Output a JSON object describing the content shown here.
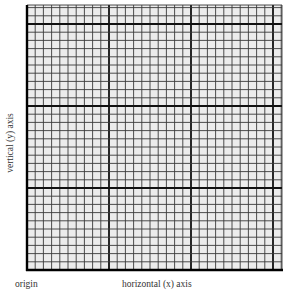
{
  "diagram": {
    "type": "graph-paper",
    "labels": {
      "y_axis": "vertical (y) axis",
      "x_axis": "horizontal (x) axis",
      "origin": "origin"
    },
    "grid": {
      "left": 27,
      "top": 5,
      "right": 282,
      "bottom": 270,
      "minor_cell_px": 8.2,
      "major_every": 10,
      "colors": {
        "background": "#ececec",
        "minor_line": "#3a3a3a",
        "major_line": "#111111",
        "axis_line": "#000000"
      }
    }
  }
}
